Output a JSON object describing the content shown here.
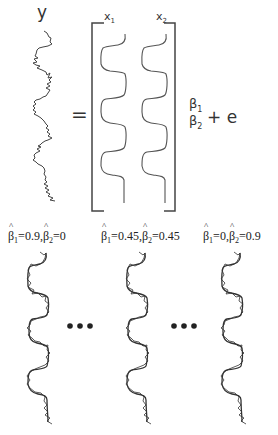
{
  "diagram": {
    "type": "linear-regression-illustration",
    "equation": {
      "lhs_label": "y",
      "equals": "=",
      "design_matrix_columns": [
        {
          "label": "x",
          "subscript": "1"
        },
        {
          "label": "x",
          "subscript": "2"
        }
      ],
      "coefficients": [
        {
          "label": "β",
          "subscript": "1"
        },
        {
          "label": "β",
          "subscript": "2"
        }
      ],
      "error_term": "+ e"
    },
    "estimates": [
      {
        "b1_sub": "1",
        "b1_val": "=0.9,",
        "b2_sub": "2",
        "b2_val": "=0"
      },
      {
        "b1_sub": "1",
        "b1_val": "=0.45,",
        "b2_sub": "2",
        "b2_val": "=0.45"
      },
      {
        "b1_sub": "1",
        "b1_val": "=0,",
        "b2_sub": "2",
        "b2_val": "=0.9"
      }
    ],
    "ellipsis": "•••",
    "colors": {
      "line": "#333333",
      "background": "#ffffff"
    }
  }
}
